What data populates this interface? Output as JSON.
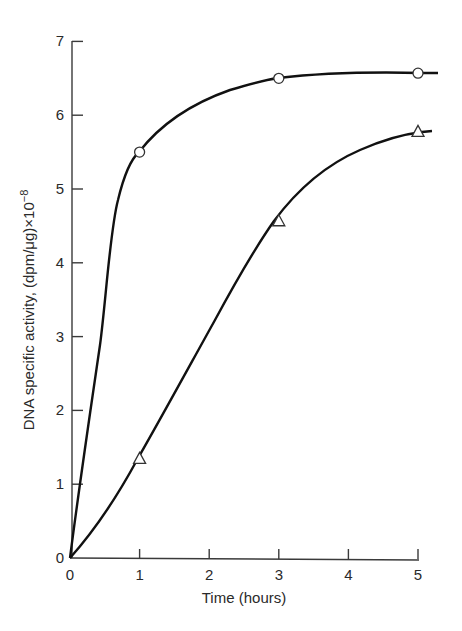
{
  "chart_data": {
    "type": "line",
    "title": "",
    "xlabel": "Time (hours)",
    "ylabel": "DNA specific activity, (dpm/μg)×10",
    "ylabel_exponent": "−8",
    "xlim": [
      0,
      5
    ],
    "ylim": [
      0,
      7
    ],
    "x_ticks": [
      "0",
      "1",
      "2",
      "3",
      "4",
      "5"
    ],
    "y_ticks": [
      "0",
      "1",
      "2",
      "3",
      "4",
      "5",
      "6",
      "7"
    ],
    "grid": false,
    "legend": null,
    "series": [
      {
        "name": "circles",
        "marker": "open-circle",
        "points": [
          {
            "x": 0,
            "y": 0
          },
          {
            "x": 1,
            "y": 5.5
          },
          {
            "x": 3,
            "y": 6.5
          },
          {
            "x": 5,
            "y": 6.57
          }
        ]
      },
      {
        "name": "triangles",
        "marker": "open-triangle",
        "points": [
          {
            "x": 0,
            "y": 0
          },
          {
            "x": 1,
            "y": 1.35
          },
          {
            "x": 3,
            "y": 4.57
          },
          {
            "x": 5,
            "y": 5.78
          }
        ]
      }
    ]
  }
}
